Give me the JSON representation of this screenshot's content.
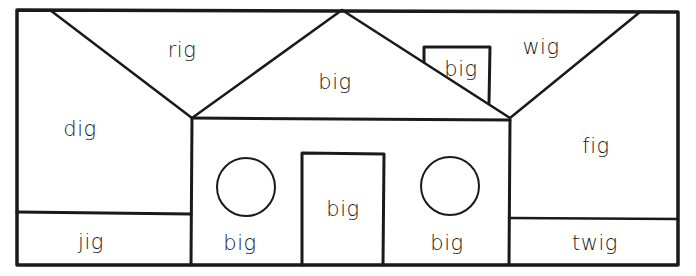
{
  "worksheet": {
    "theme": "-ig word family house",
    "colors": {
      "ink": "#1a1a1a",
      "paper": "#ffffff"
    },
    "regions": {
      "roof_left": {
        "label": "rig"
      },
      "roof_center": {
        "label": "big"
      },
      "chimney": {
        "label": "big"
      },
      "roof_right": {
        "label": "wig"
      },
      "wall_left": {
        "label": "dig"
      },
      "wall_right": {
        "label": "fig"
      },
      "ground_left": {
        "label": "jig"
      },
      "house_left": {
        "label": "big"
      },
      "door": {
        "label": "big"
      },
      "house_right": {
        "label": "big"
      },
      "ground_right": {
        "label": "twig"
      }
    }
  }
}
